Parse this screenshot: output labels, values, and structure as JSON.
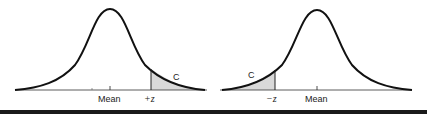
{
  "figure": {
    "panels": [
      {
        "id": "right-tail",
        "mean_label": "Mean",
        "z_label": "+z",
        "area_label": "C",
        "shaded_side": "right"
      },
      {
        "id": "left-tail",
        "mean_label": "Mean",
        "z_label": "−z",
        "area_label": "C",
        "shaded_side": "left"
      }
    ],
    "colors": {
      "curve": "#111111",
      "shade": "#d9d9d9",
      "baseline": "#333333"
    }
  }
}
